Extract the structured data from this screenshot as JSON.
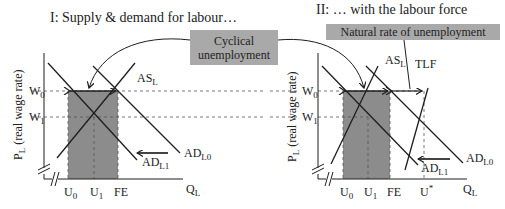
{
  "colors": {
    "line": "#1e1e1e",
    "shade": "#8c8c8c",
    "callout_bg": "#a9a9a9",
    "dash": "#555555",
    "arrow_shift": "#444444"
  },
  "panel1": {
    "title": "I: Supply & demand for labour…",
    "y_axis_label_main": "P",
    "y_axis_label_sub": "L",
    "y_axis_label_rest": " (real wage rate)",
    "x_axis_label_main": "Q",
    "x_axis_label_sub": "L",
    "w0_main": "W",
    "w0_sub": "0",
    "w1_main": "W",
    "w1_sub": "1",
    "u0_main": "U",
    "u0_sub": "0",
    "u1_main": "U",
    "u1_sub": "1",
    "fe": "FE",
    "as_main": "AS",
    "as_sub": "L",
    "ad0_main": "AD",
    "ad0_sub": "L0",
    "ad1_main": "AD",
    "ad1_sub": "L1"
  },
  "panel2": {
    "title": "II: … with the labour force",
    "y_axis_label_main": "P",
    "y_axis_label_sub": "L",
    "y_axis_label_rest": " (real wage rate)",
    "x_axis_label_main": "Q",
    "x_axis_label_sub": "L",
    "w0_main": "W",
    "w0_sub": "0",
    "w1_main": "W",
    "w1_sub": "1",
    "u0_main": "U",
    "u0_sub": "0",
    "u1_main": "U",
    "u1_sub": "1",
    "fe": "FE",
    "ustar_main": "U",
    "ustar_sup": "*",
    "as_main": "AS",
    "as_sub": "L",
    "tlf": "TLF",
    "ad0_main": "AD",
    "ad0_sub": "L0",
    "ad1_main": "AD",
    "ad1_sub": "L1"
  },
  "callouts": {
    "cyclical_line1": "Cyclical",
    "cyclical_line2": "unemployment",
    "natural": "Natural rate of unemployment"
  }
}
